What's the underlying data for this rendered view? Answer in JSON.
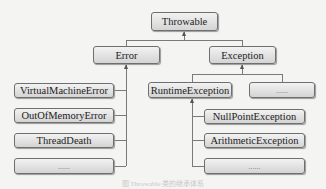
{
  "diagram": {
    "root": "Throwable",
    "level1": [
      "Error",
      "Exception"
    ],
    "error_children": [
      "VirtualMachineError",
      "OutOfMemoryError",
      "ThreadDeath",
      "......"
    ],
    "exception_children": [
      "RuntimeException",
      "......"
    ],
    "runtime_children": [
      "NullPointException",
      "ArithmeticException",
      "......"
    ],
    "caption": "图 Throwable 类的继承体系"
  }
}
